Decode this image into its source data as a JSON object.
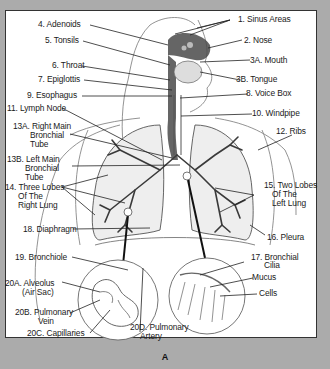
{
  "figure": {
    "caption": "A"
  },
  "labels": {
    "l1": "1. Sinus Areas",
    "l2": "2. Nose",
    "l3a": "3A. Mouth",
    "l3b": "3B. Tongue",
    "l4": "4. Adenoids",
    "l5": "5. Tonsils",
    "l6": "6. Throat",
    "l7": "7. Epiglottis",
    "l8": "8. Voice Box",
    "l9": "9. Esophagus",
    "l10": "10. Windpipe",
    "l11": "11. Lymph Node",
    "l12": "12. Ribs",
    "l13a_1": "13A. Right Main",
    "l13a_2": "Bronchial",
    "l13a_3": "Tube",
    "l13b_1": "13B. Left Main",
    "l13b_2": "Bronchial",
    "l13b_3": "Tube",
    "l14_1": "14. Three Lobes",
    "l14_2": "Of The",
    "l14_3": "Right Lung",
    "l15_1": "15. Two Lobes",
    "l15_2": "Of The",
    "l15_3": "Left Lung",
    "l16": "16. Pleura",
    "l17_1": "17. Bronchial",
    "l17_2": "Cilia",
    "l17_mucus": "Mucus",
    "l17_cells": "Cells",
    "l18": "18. Diaphragm",
    "l19": "19. Bronchiole",
    "l20a_1": "20A. Alveolus",
    "l20a_2": "(Air Sac)",
    "l20b_1": "20B. Pulmonary",
    "l20b_2": "Vein",
    "l20c": "20C. Capillaries",
    "l20d_1": "20D. Pulmonary",
    "l20d_2": "Artery"
  },
  "colors": {
    "frame": "#ababab",
    "panel": "#ffffff",
    "ink": "#1a1a1a",
    "shading": "#555555"
  }
}
